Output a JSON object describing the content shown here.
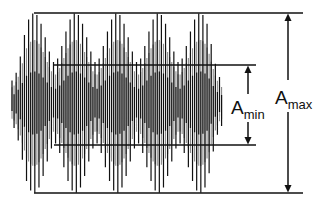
{
  "diagram": {
    "labels": {
      "amax": {
        "main": "A",
        "sub": "max"
      },
      "amin": {
        "main": "A",
        "sub": "min"
      }
    },
    "colors": {
      "line": "#111111",
      "wave_dark": "#111111",
      "wave_light": "#8a8a8a",
      "background": "#ffffff"
    },
    "reference_lines": {
      "max_top": {
        "x1": 34,
        "x2": 303,
        "y": 13
      },
      "max_bottom": {
        "x1": 34,
        "x2": 303,
        "y": 193
      },
      "min_top": {
        "x1": 54,
        "x2": 256,
        "y": 65
      },
      "min_bottom": {
        "x1": 54,
        "x2": 256,
        "y": 145
      }
    },
    "arrows": {
      "amax": {
        "x": 288,
        "y_top": 13,
        "y_bottom": 193,
        "gap_top": 80,
        "gap_bottom": 112
      },
      "amin": {
        "x": 248,
        "y_top": 65,
        "y_bottom": 145,
        "gap_top": 94,
        "gap_bottom": 122
      }
    },
    "waveform": {
      "x_start": 12,
      "x_end": 222,
      "center_y": 103,
      "amp_max": 90,
      "amp_min": 40,
      "beat_period": 41.5,
      "beat_peak_x": 34,
      "carrier_period": 4.15,
      "edge_taper": 14
    }
  }
}
